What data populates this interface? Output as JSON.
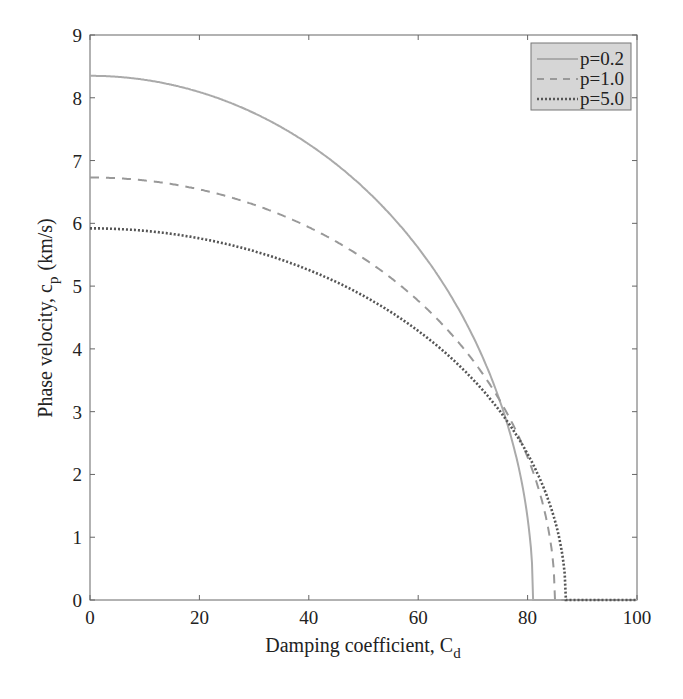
{
  "chart_data": {
    "type": "line",
    "title": "",
    "xlabel": "Damping coefficient, C_d",
    "ylabel": "Phase velocity, c_p (km/s)",
    "xlim": [
      0,
      100
    ],
    "ylim": [
      0,
      9
    ],
    "xticks": [
      0,
      20,
      40,
      60,
      80,
      100
    ],
    "yticks": [
      0,
      1,
      2,
      3,
      4,
      5,
      6,
      7,
      8,
      9
    ],
    "grid": false,
    "legend_position": "upper right",
    "series": [
      {
        "name": "p=0.2",
        "style": "solid",
        "color": "#aaaaaa",
        "c0": 8.35,
        "cutoff": 81,
        "x": [
          0,
          10,
          20,
          30,
          40,
          50,
          60,
          70,
          75,
          78,
          80,
          81,
          100
        ],
        "y": [
          8.35,
          8.28,
          8.09,
          7.76,
          7.26,
          6.57,
          5.61,
          4.2,
          3.16,
          2.26,
          1.32,
          0,
          0
        ]
      },
      {
        "name": "p=1.0",
        "style": "dashed",
        "color": "#999999",
        "c0": 6.73,
        "cutoff": 85,
        "x": [
          0,
          10,
          20,
          30,
          40,
          50,
          60,
          70,
          75,
          80,
          83,
          85,
          100
        ],
        "y": [
          6.73,
          6.68,
          6.54,
          6.3,
          5.94,
          5.44,
          4.77,
          3.82,
          3.17,
          2.27,
          1.45,
          0,
          0
        ]
      },
      {
        "name": "p=5.0",
        "style": "dotted",
        "color": "#555555",
        "c0": 5.92,
        "cutoff": 87,
        "x": [
          0,
          10,
          20,
          30,
          40,
          50,
          60,
          70,
          75,
          80,
          85,
          87,
          100
        ],
        "y": [
          5.92,
          5.88,
          5.76,
          5.56,
          5.26,
          4.84,
          4.29,
          3.52,
          3.0,
          2.33,
          1.26,
          0,
          0
        ]
      }
    ]
  },
  "axes": {
    "xlabel_main": "Damping coefficient, C",
    "xlabel_sub": "d",
    "ylabel_main": "Phase velocity, c",
    "ylabel_sub": "p",
    "ylabel_unit": "(km/s)"
  },
  "legend": {
    "items": [
      "p=0.2",
      "p=1.0",
      "p=5.0"
    ]
  }
}
